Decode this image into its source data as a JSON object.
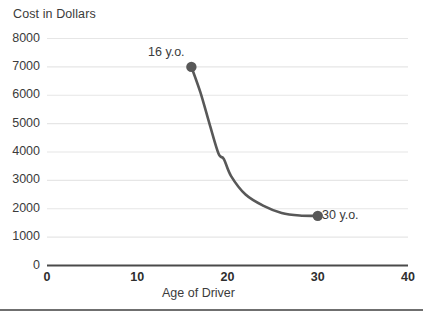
{
  "chart_data": {
    "type": "line",
    "title": "",
    "subtitle": "",
    "ylabel": "Cost in Dollars",
    "xlabel": "Age of Driver",
    "xlim": [
      0,
      40
    ],
    "ylim": [
      0,
      8000
    ],
    "grid": true,
    "legend": false,
    "legend_position": "none",
    "x_ticks": [
      "0",
      "10",
      "20",
      "30",
      "40"
    ],
    "x_tick_values": [
      0,
      10,
      20,
      30,
      40
    ],
    "y_ticks": [
      "0",
      "1000",
      "2000",
      "3000",
      "4000",
      "5000",
      "6000",
      "7000",
      "8000"
    ],
    "y_tick_values": [
      0,
      1000,
      2000,
      3000,
      4000,
      5000,
      6000,
      7000,
      8000
    ],
    "series": [
      {
        "name": "Cost of insurance by age",
        "x": [
          16,
          17,
          18,
          19,
          19.6,
          20.4,
          22,
          24,
          26,
          28,
          30
        ],
        "values": [
          7000,
          6100,
          5000,
          3950,
          3750,
          3150,
          2500,
          2100,
          1850,
          1760,
          1750
        ]
      }
    ],
    "markers": [
      {
        "label": "16 y.o.",
        "x": 16,
        "y": 7000
      },
      {
        "label": "30 y.o.",
        "x": 30,
        "y": 1750
      }
    ],
    "annotations": [
      {
        "text": "16 y.o.",
        "anchor_x": 16,
        "anchor_y": 7000,
        "placement": "above-left"
      },
      {
        "text": "30 y.o.",
        "anchor_x": 30,
        "anchor_y": 1750,
        "placement": "right"
      }
    ],
    "colors": {
      "line": "#585858",
      "marker": "#585858",
      "gridline": "#e6e6e6",
      "axis": "#4a4a4a",
      "text": "#3b3b3b",
      "background": "#ffffff",
      "rule": "#6f6f6f"
    }
  }
}
